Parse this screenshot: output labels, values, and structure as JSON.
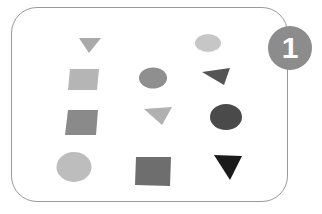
{
  "figure": {
    "badge": {
      "label": "1",
      "color": "#8c8c8c"
    },
    "frame": {
      "border_color": "#9a9a9a"
    },
    "shapes": [
      {
        "type": "triangle-down",
        "row": 1,
        "col": 1,
        "color": "#a9a9a9",
        "points": "79,38 101,38 89,53"
      },
      {
        "type": "blob",
        "row": 1,
        "col": 3,
        "color": "#c6c6c6",
        "cx": 208,
        "cy": 43,
        "rx": 13,
        "ry": 9
      },
      {
        "type": "square",
        "row": 2,
        "col": 1,
        "color": "#b5b5b5",
        "points": "70,69 99,69 97,90 68,90"
      },
      {
        "type": "circle",
        "row": 2,
        "col": 2,
        "color": "#8f8f8f",
        "cx": 153,
        "cy": 78,
        "rx": 14,
        "ry": 10.5
      },
      {
        "type": "triangle",
        "row": 2,
        "col": 3,
        "color": "#555555",
        "points": "202,72 230,68 224,85"
      },
      {
        "type": "square",
        "row": 3,
        "col": 1,
        "color": "#8a8a8a",
        "points": "68,110 98,110 96,135 65,135"
      },
      {
        "type": "triangle",
        "row": 3,
        "col": 2,
        "color": "#b0b0b0",
        "points": "144,109 172,107 162,125"
      },
      {
        "type": "circle",
        "row": 3,
        "col": 3,
        "color": "#4a4a4a",
        "cx": 226,
        "cy": 117,
        "rx": 16,
        "ry": 13
      },
      {
        "type": "circle",
        "row": 4,
        "col": 1,
        "color": "#bdbdbd",
        "cx": 74,
        "cy": 167,
        "rx": 17.5,
        "ry": 15
      },
      {
        "type": "square",
        "row": 4,
        "col": 2,
        "color": "#6e6e6e",
        "points": "136,157 171,157 170,186 135,185"
      },
      {
        "type": "triangle-down",
        "row": 4,
        "col": 3,
        "color": "#1a1a1a",
        "points": "214,155 242,156 230,180"
      }
    ]
  }
}
